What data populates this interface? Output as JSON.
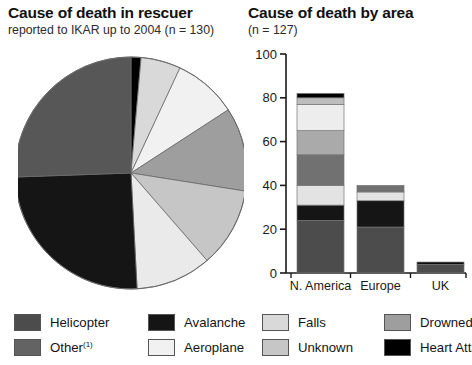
{
  "pie_panel": {
    "title": "Cause of death in rescuer",
    "subtitle": "reported to IKAR up to 2004 (n = 130)"
  },
  "bar_panel": {
    "title": "Cause of death by area",
    "subtitle": "(n = 127)"
  },
  "legend": {
    "items": [
      {
        "label": "Helicopter",
        "color": "#4c4c4c",
        "sup": ""
      },
      {
        "label": "Other",
        "color": "#636363",
        "sup": "(1)"
      },
      {
        "label": "Avalanche",
        "color": "#151515",
        "sup": ""
      },
      {
        "label": "Aeroplane",
        "color": "#f1f1f1",
        "sup": ""
      },
      {
        "label": "Falls",
        "color": "#d9d9d9",
        "sup": ""
      },
      {
        "label": "Unknown",
        "color": "#c6c6c6",
        "sup": ""
      },
      {
        "label": "Drowned",
        "color": "#9e9e9e",
        "sup": ""
      },
      {
        "label": "Heart Attack",
        "color": "#000000",
        "sup": ""
      }
    ]
  },
  "chart_data": [
    {
      "type": "pie",
      "title": "Cause of death in rescuer",
      "subtitle": "reported to IKAR up to 2004 (n = 130)",
      "total_n": 130,
      "units": "degrees",
      "note": "slices listed clockwise starting at 12 o'clock",
      "categories": [
        "Heart Attack",
        "Unknown",
        "Aeroplane",
        "Drowned",
        "Unknown",
        "Falls",
        "Avalanche",
        "Helicopter"
      ],
      "values": [
        5,
        20,
        32,
        42,
        40,
        38,
        91,
        92
      ],
      "colors": [
        "#000000",
        "#d9d9d9",
        "#f1f1f1",
        "#9e9e9e",
        "#c6c6c6",
        "#eaeaea",
        "#151515",
        "#575757"
      ],
      "legend_position": "bottom",
      "grid": false
    },
    {
      "type": "bar",
      "subtype": "stacked",
      "title": "Cause of death by area",
      "subtitle": "(n = 127)",
      "total_n": 127,
      "xlabel": "",
      "ylabel": "",
      "ylim": [
        0,
        100
      ],
      "yticks": [
        0,
        20,
        40,
        60,
        80,
        100
      ],
      "grid": false,
      "legend_position": "bottom",
      "categories": [
        "N. America",
        "Europe excluding UK",
        "UK"
      ],
      "series": [
        {
          "name": "Helicopter",
          "color": "#4c4c4c",
          "values": [
            24,
            21,
            4
          ]
        },
        {
          "name": "Avalanche",
          "color": "#151515",
          "values": [
            7,
            12,
            0
          ]
        },
        {
          "name": "Falls",
          "color": "#e3e3e3",
          "values": [
            9,
            4,
            0
          ]
        },
        {
          "name": "Drowned",
          "color": "#717171",
          "values": [
            14,
            3,
            0
          ]
        },
        {
          "name": "Unknown",
          "color": "#aaaaaa",
          "values": [
            11,
            0,
            0
          ]
        },
        {
          "name": "Aeroplane",
          "color": "#ededed",
          "values": [
            12,
            0,
            0
          ]
        },
        {
          "name": "Other",
          "color": "#bdbdbd",
          "values": [
            3,
            0,
            0
          ]
        },
        {
          "name": "Heart Attack",
          "color": "#000000",
          "values": [
            2,
            0,
            1
          ]
        }
      ],
      "totals": [
        82,
        40,
        5
      ]
    }
  ]
}
